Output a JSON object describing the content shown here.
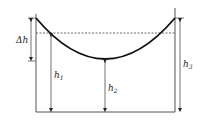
{
  "diagram": {
    "labels": {
      "delta_h": "Δh",
      "h1": "h",
      "h1_sub": "1",
      "h2": "h",
      "h2_sub": "2",
      "h3": "h",
      "h3_sub": "3"
    },
    "colors": {
      "line": "#222222",
      "background": "#ffffff"
    }
  }
}
